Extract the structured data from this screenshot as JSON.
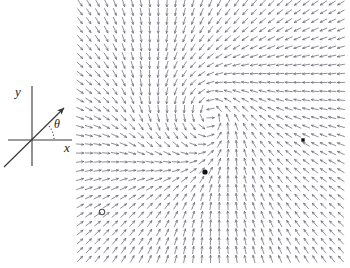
{
  "figure": {
    "background_color": "#ffffff",
    "width": 350,
    "height": 268
  },
  "axes_inset": {
    "name": "coordinate-axes-inset",
    "origin": {
      "x": 32,
      "y": 140
    },
    "x_axis": {
      "label": "x",
      "label_x": 67,
      "label_y": 152,
      "x1": 8,
      "y1": 140,
      "x2": 72,
      "y2": 140
    },
    "y_axis": {
      "label": "y",
      "label_x": 18,
      "label_y": 96,
      "x1": 32,
      "y1": 86,
      "x2": 32,
      "y2": 166
    },
    "angle": {
      "label": "θ",
      "label_x": 57,
      "label_y": 128,
      "arc_radius": 22,
      "arc_start_deg": 0,
      "arc_end_deg": 42,
      "arc_tick_count": 5
    },
    "ray": {
      "name": "theta-ray",
      "from_x": 4,
      "from_y": 167,
      "to_x": 64,
      "to_y": 108,
      "arrow_head": true,
      "color": "#3a3a3a"
    },
    "stroke_color": "#3a3a3a"
  },
  "vector_field": {
    "name": "direction-field-plot",
    "plot_box": {
      "left": 80,
      "top": 3,
      "right": 341,
      "bottom": 259
    },
    "grid_cols": 31,
    "grid_rows": 30,
    "arrow_color": "#6a6a76",
    "arrow_length": 7.2,
    "arrow_head_size": 2.1,
    "legend_position": "none",
    "grid": false
  },
  "chart_data": {
    "type": "scatter",
    "xlabel": "x",
    "ylabel": "y",
    "xlim": [
      -3.0,
      3.0
    ],
    "ylim": [
      -3.0,
      3.0
    ],
    "grid": false,
    "field": {
      "description": "Two-dimensional autonomous direction field; unit arrows drawn on a 31 x 30 lattice",
      "u_expression": "-(y - 0.45) - 0.55*(x + 0.45)*((x + 0.45)*(x + 0.45) + (y - 0.45)*(y - 0.45))",
      "v_expression": "(x + 0.45) - 0.55*(y - 0.45)*((x + 0.45)*(x + 0.45) + (y - 0.45)*(y - 0.45)) + 0.30*(x - 1.55)",
      "normalized": true
    },
    "critical_points": [
      {
        "name": "spiral-point",
        "px": 205,
        "py": 172,
        "marker": "filled-circle",
        "radius": 2.6,
        "color": "#111111"
      },
      {
        "name": "saddle-point",
        "px": 303,
        "py": 140,
        "marker": "filled-square",
        "size": 3.4,
        "color": "#111111"
      },
      {
        "name": "open-node-point",
        "px": 102,
        "py": 212,
        "marker": "open-circle",
        "radius": 2.7,
        "color": "#555560"
      }
    ]
  }
}
